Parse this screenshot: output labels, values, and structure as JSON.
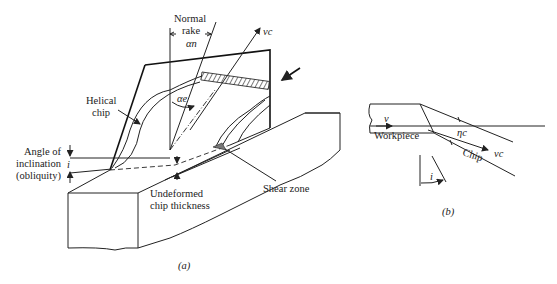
{
  "figure_a": {
    "caption": "(a)",
    "labels": {
      "normal_rake_line1": "Normal",
      "normal_rake_line2": "rake",
      "normal_rake_symbol": "αn",
      "vc": "vc",
      "alpha_e": "αe",
      "helical_chip_line1": "Helical",
      "helical_chip_line2": "chip",
      "angle_incl_line1": "Angle of",
      "angle_incl_line2": "inclination",
      "angle_incl_line3": "(obliquity)",
      "i_symbol": "i",
      "undeformed_line1": "Undeformed",
      "undeformed_line2": "chip thickness",
      "shear_zone": "Shear zone"
    }
  },
  "figure_b": {
    "caption": "(b)",
    "labels": {
      "v": "v",
      "workpiece": "Workpiece",
      "eta_c": "ηc",
      "chip": "Chip",
      "vc": "vc",
      "i_symbol": "i"
    }
  }
}
